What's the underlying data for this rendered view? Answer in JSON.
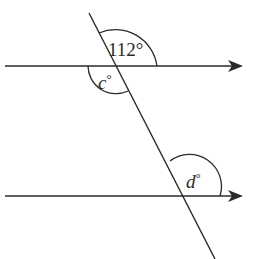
{
  "diagram": {
    "type": "parallel-lines-transversal",
    "angles": {
      "top_given": "112°",
      "c": {
        "var": "c",
        "deg": "°"
      },
      "d": {
        "var": "d",
        "deg": "°"
      }
    },
    "colors": {
      "stroke": "#2a2a2a",
      "background": "#ffffff"
    }
  }
}
